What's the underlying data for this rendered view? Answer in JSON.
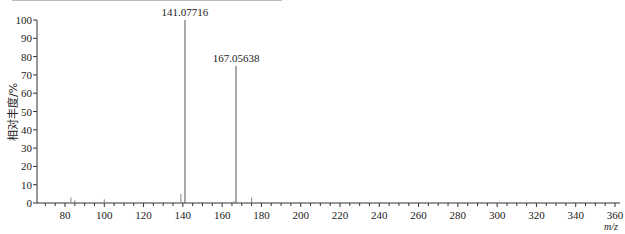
{
  "chart_data": {
    "type": "bar",
    "subtype": "mass-spectrum-stick",
    "title": "",
    "xlabel": "m/z",
    "ylabel": "相对丰度/%",
    "xlim": [
      66,
      361
    ],
    "ylim": [
      0,
      100
    ],
    "x_ticks": [
      80,
      100,
      120,
      140,
      160,
      180,
      200,
      220,
      240,
      260,
      280,
      300,
      320,
      340,
      360
    ],
    "y_ticks": [
      0,
      10,
      20,
      30,
      40,
      50,
      60,
      70,
      80,
      90,
      100
    ],
    "grid": false,
    "legend": null,
    "peaks": [
      {
        "mz": 83.0,
        "intensity": 3,
        "label": ""
      },
      {
        "mz": 85.0,
        "intensity": 1.5,
        "label": ""
      },
      {
        "mz": 100.0,
        "intensity": 2,
        "label": ""
      },
      {
        "mz": 139.0,
        "intensity": 5,
        "label": ""
      },
      {
        "mz": 141.07716,
        "intensity": 100,
        "label": "141.07716"
      },
      {
        "mz": 166.0,
        "intensity": 1,
        "label": ""
      },
      {
        "mz": 167.05638,
        "intensity": 75,
        "label": "167.05638"
      },
      {
        "mz": 175.0,
        "intensity": 3,
        "label": ""
      }
    ]
  },
  "labels": {
    "ylabel": "相对丰度/%",
    "xunit": "m/z"
  }
}
